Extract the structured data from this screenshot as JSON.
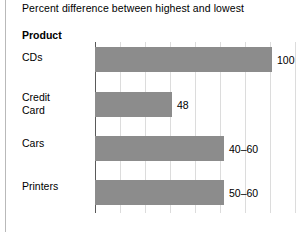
{
  "chart_data": {
    "type": "bar",
    "orientation": "horizontal",
    "title": "Percent difference between highest and lowest",
    "category_axis_header": "Product",
    "xlabel": "",
    "ylabel": "Product",
    "xlim": [
      0,
      115
    ],
    "grid": true,
    "gridline_step": 14.1,
    "legend": "none",
    "bar_color": "#8c8c8c",
    "categories": [
      "CDs",
      "Credit Card",
      "Cars",
      "Printers"
    ],
    "values": [
      100,
      48,
      50,
      55
    ],
    "value_labels": [
      "100",
      "48",
      "40–60",
      "50–60"
    ],
    "points": [
      {
        "category": "CDs",
        "category_lines": "CDs",
        "value": 100,
        "label": "100",
        "bar_width_px": 177
      },
      {
        "category": "Credit Card",
        "category_lines": "Credit\nCard",
        "value": 48,
        "label": "48",
        "bar_width_px": 77
      },
      {
        "category": "Cars",
        "category_lines": "Cars",
        "value": 50,
        "label": "40–60",
        "bar_width_px": 129
      },
      {
        "category": "Printers",
        "category_lines": "Printers",
        "value": 55,
        "label": "50–60",
        "bar_width_px": 129
      }
    ]
  }
}
